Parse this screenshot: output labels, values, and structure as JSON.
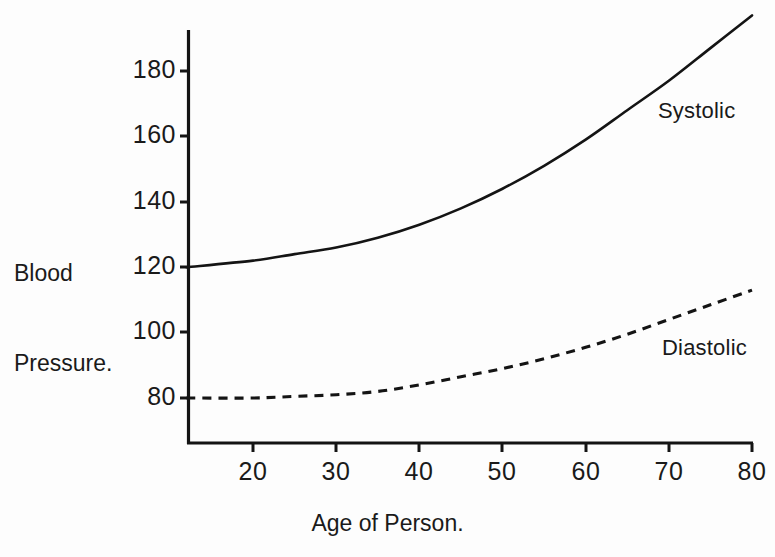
{
  "chart_data": {
    "type": "line",
    "title": "",
    "xlabel": "Age of Person.",
    "ylabel": "Blood\nPressure.",
    "ylabel_line1": "Blood",
    "ylabel_line2": "Pressure.",
    "xlim": [
      12,
      80
    ],
    "ylim": [
      62,
      200
    ],
    "xticks": [
      20,
      30,
      40,
      50,
      60,
      70,
      80
    ],
    "xtick_labels": [
      "20",
      "30",
      "40",
      "50",
      "60",
      "70",
      "80"
    ],
    "yticks": [
      80,
      100,
      120,
      140,
      160,
      180
    ],
    "ytick_labels": [
      "80",
      "100",
      "120",
      "140",
      "160",
      "180"
    ],
    "grid": false,
    "legend_position": "inline-right",
    "series": [
      {
        "name": "Systolic",
        "style": "solid",
        "color": "#141414",
        "x": [
          12,
          20,
          25,
          30,
          35,
          40,
          45,
          50,
          55,
          60,
          65,
          70,
          75,
          80
        ],
        "values": [
          120,
          122,
          124,
          126,
          129,
          133,
          138,
          144,
          151,
          159,
          168,
          177,
          187,
          197
        ]
      },
      {
        "name": "Diastolic",
        "style": "dashed",
        "color": "#141414",
        "x": [
          12,
          20,
          25,
          30,
          35,
          40,
          45,
          50,
          55,
          60,
          65,
          70,
          75,
          80
        ],
        "values": [
          80,
          80,
          80.5,
          81,
          82,
          84,
          86.5,
          89,
          92,
          95.5,
          99.5,
          104,
          108.5,
          113
        ]
      }
    ],
    "annotations": [
      {
        "text": "Systolic",
        "near_x": 68,
        "near_y": 172
      },
      {
        "text": "Diastolic",
        "near_x": 68,
        "near_y": 97
      }
    ]
  },
  "axis": {
    "y_title_line1": "Blood",
    "y_title_line2": "Pressure.",
    "x_title": "Age of Person.",
    "y_tick_180": "180",
    "y_tick_160": "160",
    "y_tick_140": "140",
    "y_tick_120": "120",
    "y_tick_100": "100",
    "y_tick_80": "80",
    "x_tick_20": "20",
    "x_tick_30": "30",
    "x_tick_40": "40",
    "x_tick_50": "50",
    "x_tick_60": "60",
    "x_tick_70": "70",
    "x_tick_80": "80"
  },
  "labels": {
    "systolic": "Systolic",
    "diastolic": "Diastolic"
  },
  "colors": {
    "ink": "#141414",
    "background": "#fdfdfd"
  }
}
